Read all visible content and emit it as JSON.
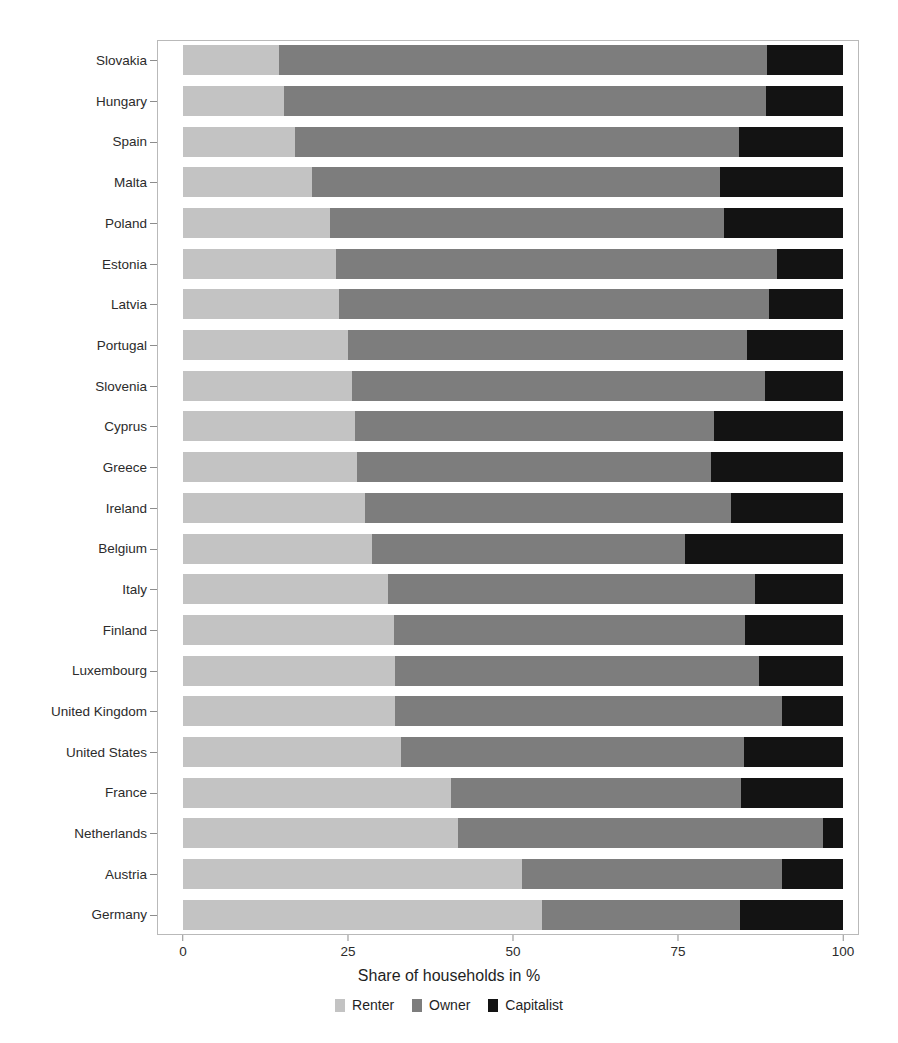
{
  "chart_data": {
    "type": "bar",
    "orientation": "horizontal",
    "stacked": true,
    "normalized_percent": true,
    "title": "",
    "xlabel": "Share of households in %",
    "ylabel": "",
    "xlim": [
      0,
      100
    ],
    "xticks": [
      0,
      25,
      50,
      75,
      100
    ],
    "xtick_labels": [
      "0",
      "25",
      "50",
      "75",
      "100"
    ],
    "grid": false,
    "legend_position": "bottom",
    "categories": [
      "Slovakia",
      "Hungary",
      "Spain",
      "Malta",
      "Poland",
      "Estonia",
      "Latvia",
      "Portugal",
      "Slovenia",
      "Cyprus",
      "Greece",
      "Ireland",
      "Belgium",
      "Italy",
      "Finland",
      "Luxembourg",
      "United Kingdom",
      "United States",
      "France",
      "Netherlands",
      "Austria",
      "Germany"
    ],
    "series": [
      {
        "name": "Renter",
        "color": "#c3c3c3",
        "values": [
          14.6,
          15.3,
          16.9,
          19.5,
          22.2,
          23.2,
          23.6,
          25.0,
          25.6,
          26.0,
          26.4,
          27.5,
          28.7,
          31.0,
          31.9,
          32.1,
          32.1,
          33.0,
          40.6,
          41.7,
          51.4,
          54.4
        ]
      },
      {
        "name": "Owner",
        "color": "#7d7d7d",
        "values": [
          73.9,
          73.0,
          67.3,
          61.8,
          59.8,
          66.8,
          65.2,
          60.4,
          62.6,
          54.4,
          53.6,
          55.5,
          47.3,
          55.6,
          53.2,
          55.2,
          58.7,
          52.0,
          44.0,
          55.3,
          39.4,
          30.0
        ]
      },
      {
        "name": "Capitalist",
        "color": "#131313",
        "values": [
          11.5,
          11.7,
          15.8,
          18.7,
          18.0,
          10.0,
          11.2,
          14.6,
          11.8,
          19.6,
          20.0,
          17.0,
          24.0,
          13.4,
          14.9,
          12.7,
          9.2,
          15.0,
          15.4,
          3.0,
          9.2,
          15.6
        ]
      }
    ],
    "legend": [
      {
        "label": "Renter",
        "color": "#c3c3c3",
        "swatch": "renter-swatch"
      },
      {
        "label": "Owner",
        "color": "#7d7d7d",
        "swatch": "owner-swatch"
      },
      {
        "label": "Capitalist",
        "color": "#131313",
        "swatch": "capitalist-swatch"
      }
    ]
  },
  "axes": {
    "x_title": "Share of households in %",
    "x_tick_labels": [
      "0",
      "25",
      "50",
      "75",
      "100"
    ],
    "y_tick_labels": [
      "Slovakia",
      "Hungary",
      "Spain",
      "Malta",
      "Poland",
      "Estonia",
      "Latvia",
      "Portugal",
      "Slovenia",
      "Cyprus",
      "Greece",
      "Ireland",
      "Belgium",
      "Italy",
      "Finland",
      "Luxembourg",
      "United Kingdom",
      "United States",
      "France",
      "Netherlands",
      "Austria",
      "Germany"
    ]
  },
  "colors": {
    "renter": "#c3c3c3",
    "owner": "#7d7d7d",
    "capitalist": "#131313",
    "axis": "#8d8d8d",
    "frame": "#b9b9b9",
    "text": "#1f1f1f",
    "background": "#ffffff"
  }
}
